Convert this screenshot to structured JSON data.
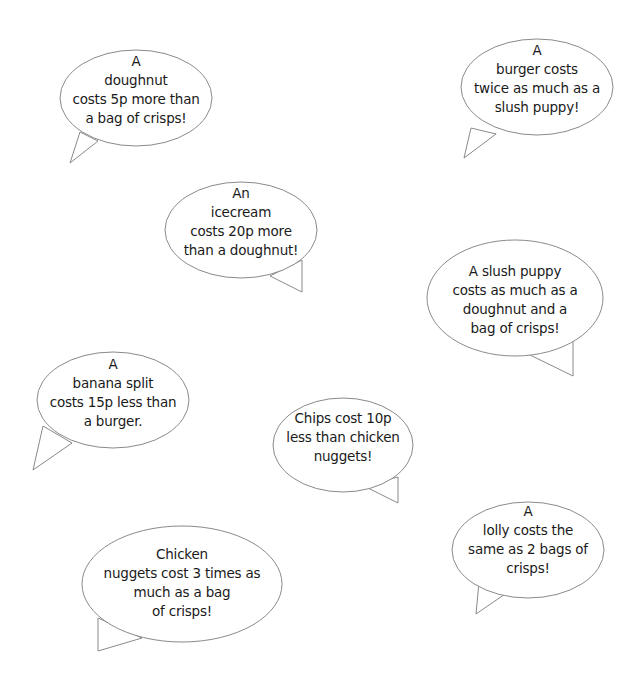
{
  "colors": {
    "background": "#ffffff",
    "bubble_fill": "#ffffff",
    "bubble_outline": "#8a8a8a",
    "text": "#1a1a1a"
  },
  "bubbles": [
    {
      "id": "doughnut",
      "lines": [
        "A",
        "doughnut",
        "costs 5p more than",
        "a bag of crisps!"
      ]
    },
    {
      "id": "burger",
      "lines": [
        "A",
        "burger costs",
        "twice as much as a",
        "slush puppy!"
      ]
    },
    {
      "id": "icecream",
      "lines": [
        "An",
        "icecream",
        "costs 20p more",
        "than a doughnut!"
      ]
    },
    {
      "id": "slush-puppy",
      "lines": [
        "A slush puppy",
        "costs as much as a",
        "doughnut and a",
        "bag of crisps!"
      ]
    },
    {
      "id": "banana-split",
      "lines": [
        "A",
        "banana split",
        "costs 15p less than",
        "a burger."
      ]
    },
    {
      "id": "chips",
      "lines": [
        "Chips cost 10p",
        "less than chicken",
        "nuggets!"
      ]
    },
    {
      "id": "lolly",
      "lines": [
        "A",
        "lolly costs the",
        "same as 2 bags of",
        "crisps!"
      ]
    },
    {
      "id": "chicken-nuggets",
      "lines": [
        "Chicken",
        "nuggets cost 3 times as",
        "much as a bag",
        "of crisps!"
      ]
    }
  ]
}
